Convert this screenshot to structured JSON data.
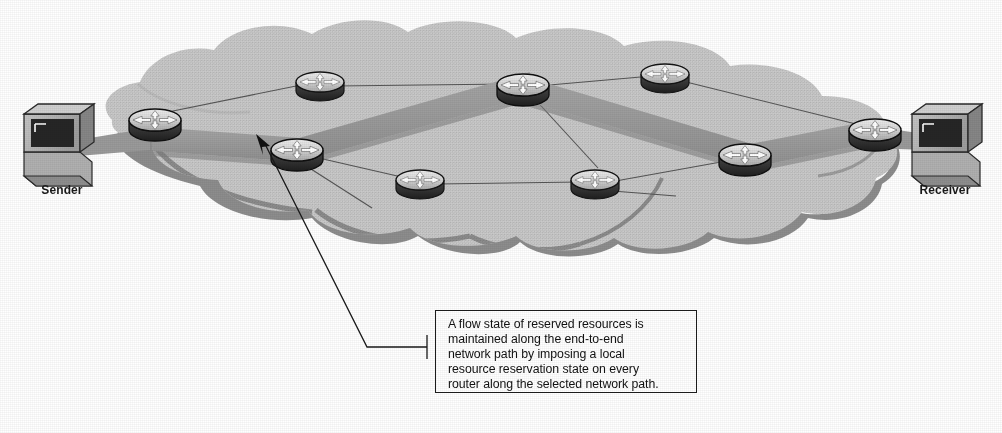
{
  "diagram": {
    "type": "network-topology",
    "colors": {
      "cloud_fill": "#c9c9c9",
      "cloud_edge": "#8a8a8a",
      "cloud_shadow": "#8f8f8f",
      "path_band": "#9b9b9b",
      "path_band_dark": "#8c8c8c",
      "link_line": "#5a5a5a",
      "router_body": "#3a3a3a",
      "router_top": "#d8d8d8",
      "router_arrow": "#ffffff",
      "host_bezel": "#b4b4b4",
      "host_screen": "#242424",
      "callout_border": "#1c1c1c",
      "text": "#121212"
    }
  },
  "endpoints": {
    "sender": {
      "label": "Sender",
      "icon": "workstation-icon",
      "x": 62,
      "y": 145
    },
    "receiver": {
      "label": "Receiver",
      "icon": "workstation-icon",
      "x": 945,
      "y": 145
    }
  },
  "routers": [
    {
      "id": "r-edge-left",
      "name": "edge-router-left",
      "icon": "router-icon",
      "x": 155,
      "y": 120,
      "on_path": true
    },
    {
      "id": "r-top-left",
      "name": "router-top-left",
      "icon": "router-icon",
      "x": 320,
      "y": 82,
      "on_path": false
    },
    {
      "id": "r-mid-left",
      "name": "router-middle-left",
      "icon": "router-icon",
      "x": 297,
      "y": 150,
      "on_path": true
    },
    {
      "id": "r-bottom-left",
      "name": "router-bottom-left",
      "icon": "router-icon",
      "x": 420,
      "y": 180,
      "on_path": false
    },
    {
      "id": "r-top-center",
      "name": "router-top-center",
      "icon": "router-icon",
      "x": 523,
      "y": 85,
      "on_path": true
    },
    {
      "id": "r-bottom-right",
      "name": "router-bottom-right",
      "icon": "router-icon",
      "x": 595,
      "y": 180,
      "on_path": false
    },
    {
      "id": "r-top-right",
      "name": "router-top-right",
      "icon": "router-icon",
      "x": 665,
      "y": 74,
      "on_path": false
    },
    {
      "id": "r-mid-right",
      "name": "router-middle-right",
      "icon": "router-icon",
      "x": 745,
      "y": 155,
      "on_path": true
    },
    {
      "id": "r-edge-right",
      "name": "edge-router-right",
      "icon": "router-icon",
      "x": 875,
      "y": 130,
      "on_path": true
    }
  ],
  "reserved_path": {
    "description": "Thick highlighted band showing the end-to-end reserved resource path",
    "hops": [
      "Sender",
      "edge-router-left",
      "router-middle-left",
      "router-top-center",
      "router-middle-right",
      "edge-router-right",
      "Receiver"
    ]
  },
  "links": [
    {
      "from": "r-edge-left",
      "to": "r-top-left"
    },
    {
      "from": "r-top-left",
      "to": "r-top-center"
    },
    {
      "from": "r-mid-left",
      "to": "r-bottom-left"
    },
    {
      "from": "r-bottom-left",
      "to": "r-bottom-right"
    },
    {
      "from": "r-top-center",
      "to": "r-top-right"
    },
    {
      "from": "r-top-center",
      "to": "r-bottom-right"
    },
    {
      "from": "r-top-right",
      "to": "r-edge-right"
    },
    {
      "from": "r-bottom-right",
      "to": "r-mid-right"
    },
    {
      "from": "r-mid-right",
      "to": "r-edge-right"
    }
  ],
  "callout": {
    "text": "A flow state of reserved resources is maintained along the end-to-end network path by imposing a local resource reservation state on every router along the selected network path.",
    "lines": [
      "A flow state of reserved resources is",
      "maintained along the end-to-end",
      "network path by imposing a local",
      "resource reservation state on every",
      "router along the selected network path."
    ],
    "leader": {
      "arrow_tip_x": 258,
      "arrow_tip_y": 136,
      "elbow_x": 367,
      "elbow_y": 347,
      "box_x": 427,
      "box_y": 347
    }
  }
}
